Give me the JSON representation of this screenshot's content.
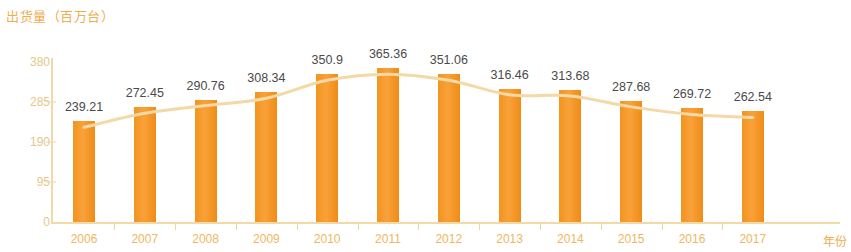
{
  "chart_data": {
    "type": "bar",
    "title": "出货量（百万台）",
    "xlabel": "年份",
    "ylabel": "",
    "categories": [
      "2006",
      "2007",
      "2008",
      "2009",
      "2010",
      "2011",
      "2012",
      "2013",
      "2014",
      "2015",
      "2016",
      "2017"
    ],
    "values": [
      239.21,
      272.45,
      290.76,
      308.34,
      350.9,
      365.36,
      351.06,
      316.46,
      313.68,
      287.68,
      269.72,
      262.54
    ],
    "value_labels": [
      "239.21",
      "272.45",
      "290.76",
      "308.34",
      "350.9",
      "365.36",
      "351.06",
      "316.46",
      "313.68",
      "287.68",
      "269.72",
      "262.54"
    ],
    "yticks": [
      0,
      95,
      190,
      285,
      380
    ],
    "ytick_labels": [
      "0",
      "95",
      "190",
      "285",
      "380"
    ],
    "ylim": [
      0,
      380
    ],
    "grid": false,
    "legend": null,
    "series": [
      {
        "name": "出货量",
        "type": "bar",
        "values": [
          239.21,
          272.45,
          290.76,
          308.34,
          350.9,
          365.36,
          351.06,
          316.46,
          313.68,
          287.68,
          269.72,
          262.54
        ]
      },
      {
        "name": "趋势线",
        "type": "line",
        "values": [
          239.21,
          272.45,
          290.76,
          308.34,
          350.9,
          365.36,
          351.06,
          316.46,
          313.68,
          287.68,
          269.72,
          262.54
        ]
      }
    ],
    "colors": {
      "bar": "#f4901f",
      "trend_line": "#f3d9a6",
      "title": "#f0ad4e",
      "axis": "#f2d9a8",
      "ytick_label": "#e8c68a",
      "xtick_label": "#f0b661",
      "value_label": "#4a4a4a"
    }
  }
}
